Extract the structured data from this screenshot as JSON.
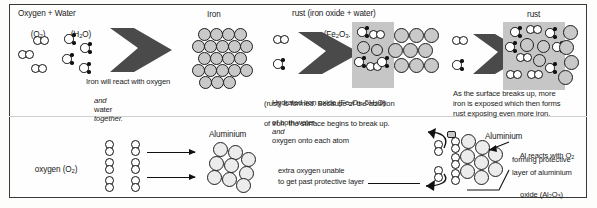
{
  "figure": {
    "divider_label": "section-divider"
  },
  "top_row": {
    "stage1": {
      "heading_line1": "Oxygen + Water",
      "heading_line2_oxygen": "(O",
      "heading_line2_oxygen_sub": "2",
      "heading_line2_oxygen_end": ")",
      "heading_line2_water": "(H",
      "heading_line2_water_sub": "2",
      "heading_line2_water_end": "O)",
      "caption_line1": "Iron will react with oxygen",
      "caption_line2_a": "and",
      "caption_line2_b": "water",
      "caption_line2_c": "together.",
      "arrow_name": "reaction-arrow-1"
    },
    "stage2": {
      "label": "Iron",
      "lattice_name": "iron-lattice"
    },
    "stage3": {
      "heading_line1": "rust (iron oxide + water)",
      "heading_line2_pre": "(Fe",
      "heading_line2_sub1": "2",
      "heading_line2_mid": "O",
      "heading_line2_sub2": "3",
      "heading_line2_mid2": ". 5H",
      "heading_line2_sub3": "2",
      "heading_line2_end": "O)",
      "caption_line1_a": "Hydrated iron oxide (Fe",
      "caption_line1_sub1": "2",
      "caption_line1_b": "O",
      "caption_line1_sub2": "3",
      "caption_line1_c": ". 5H",
      "caption_line1_sub3": "2",
      "caption_line1_d": "O)",
      "caption_line2": "(rust) is formed. Because of the addition",
      "caption_line3_a": "of both water",
      "caption_line3_b": "and",
      "caption_line3_c": "oxygen onto each atom",
      "caption_line4": "of iron, the surface begins to break up.",
      "arrow_name": "reaction-arrow-2"
    },
    "stage4": {
      "label": "rust",
      "caption_line1": "As the surface breaks up, more",
      "caption_line2": "iron is exposed which then forms",
      "caption_line3": "rust exposing even more iron.",
      "arrow_name": "reaction-arrow-3"
    }
  },
  "bottom_row": {
    "oxygen_label_pre": "oxygen (O",
    "oxygen_label_sub": "2",
    "oxygen_label_end": ")",
    "aluminium_label": "Aluminium",
    "aluminium_label_right": "Aluminium",
    "extra_oxygen_line1": "extra oxygen unable",
    "extra_oxygen_line2": "to get past protective layer",
    "al_caption_line1_a": "Al reacts with O",
    "al_caption_line1_sub": "2",
    "al_caption_line2": "forming protective",
    "al_caption_line3": "layer of aluminium",
    "al_caption_line4_a": "oxide (Al",
    "al_caption_line4_sub1": "2",
    "al_caption_line4_b": "O",
    "al_caption_line4_sub2": "3",
    "al_caption_line4_c": ")",
    "arrow_top_name": "oxygen-to-aluminium-arrow-top",
    "arrow_bottom_name": "oxygen-to-aluminium-arrow-bottom"
  },
  "colors": {
    "metal_atom": "#c9c9c9",
    "pale_atom": "#ececec",
    "rust_blob": "#c6c6c6",
    "ink": "#1a1a1a",
    "frame": "#3a3a3a"
  }
}
